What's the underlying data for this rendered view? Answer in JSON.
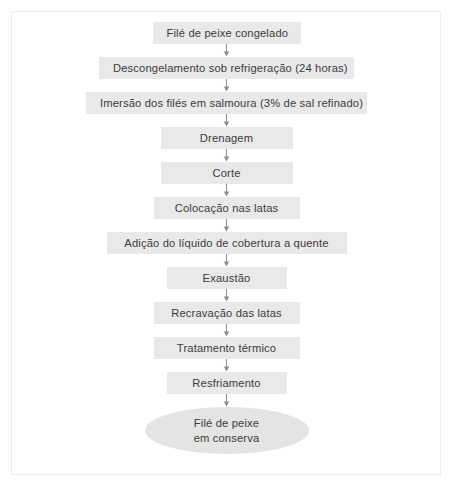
{
  "diagram": {
    "colors": {
      "box_fill": "#e9e9e9",
      "ellipse_fill": "#e4e4e4",
      "text": "#3b3b3b",
      "arrow": "#8e8e8e",
      "frame_border": "#ededed",
      "background": "#ffffff"
    },
    "steps": [
      {
        "label": "Filé de peixe congelado",
        "shape": "rectangle",
        "width": 148
      },
      {
        "label": "Descongelamento sob refrigeração (24 horas)",
        "shape": "rectangle",
        "width": 255
      },
      {
        "label": "Imersão dos filés em salmoura (3% de sal refinado)",
        "shape": "rectangle",
        "width": 281
      },
      {
        "label": "Drenagem",
        "shape": "rectangle",
        "width": 132
      },
      {
        "label": "Corte",
        "shape": "rectangle",
        "width": 132
      },
      {
        "label": "Colocação nas latas",
        "shape": "rectangle",
        "width": 146
      },
      {
        "label": "Adição do líquido de cobertura a quente",
        "shape": "rectangle",
        "width": 240
      },
      {
        "label": "Exaustão",
        "shape": "rectangle",
        "width": 120
      },
      {
        "label": "Recravação das latas",
        "shape": "rectangle",
        "width": 146
      },
      {
        "label": "Tratamento térmico",
        "shape": "rectangle",
        "width": 146
      },
      {
        "label": "Resfriamento",
        "shape": "rectangle",
        "width": 120
      }
    ],
    "terminator": {
      "shape": "ellipse",
      "line1": "Filé de peixe",
      "line2": "em conserva"
    }
  }
}
